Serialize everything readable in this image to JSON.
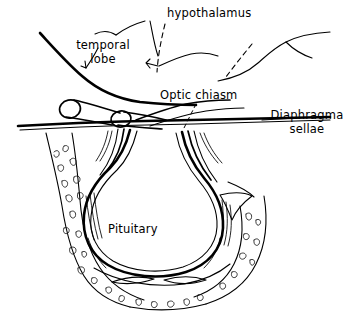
{
  "figure": {
    "kind": "anatomical-line-drawing",
    "background_color": "#ffffff",
    "ink_color": "#000000"
  },
  "labels": {
    "hypothalamus": "hypothalamus",
    "temporal_lobe_line1": "temporal",
    "temporal_lobe_line2": "lobe",
    "optic_chiasm": "Optic chiasm",
    "diaphragma_line1": "Diaphragma",
    "diaphragma_line2": "sellae",
    "pituitary": "Pituitary"
  },
  "structures": [
    "temporal-lobe-contour",
    "hypothalamus-contour",
    "optic-nerve-left",
    "optic-nerve-right",
    "optic-chiasm-band",
    "diaphragma-sellae-membrane",
    "pituitary-gland",
    "infundibulum-stalk",
    "sella-turcica-bone",
    "posterior-clinoid-process",
    "sphenoid-sinus-slits",
    "cancellous-bone-texture"
  ]
}
